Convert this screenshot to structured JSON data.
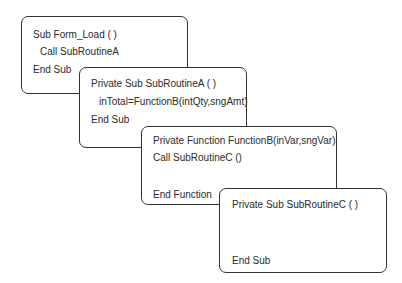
{
  "diagram": {
    "boxes": [
      {
        "id": "form-load",
        "lines": [
          "Sub Form_Load ( )",
          "Call  SubRoutineA",
          "End Sub"
        ]
      },
      {
        "id": "subroutine-a",
        "lines": [
          "Private Sub SubRoutineA ( )",
          "inTotal=FunctionB(intQty,sngAmt)",
          "End Sub"
        ]
      },
      {
        "id": "function-b",
        "lines": [
          "Private Function FunctionB(inVar,sngVar)",
          "Call SubRoutineC ()",
          "End Function"
        ]
      },
      {
        "id": "subroutine-c",
        "lines": [
          "Private Sub SubRoutineC ( )",
          "End Sub"
        ]
      }
    ],
    "colors": {
      "border": "#333333",
      "text": "#2b2b2b",
      "background": "#ffffff"
    }
  }
}
